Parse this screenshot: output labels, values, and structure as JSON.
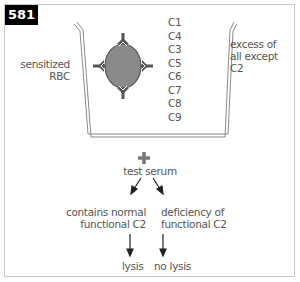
{
  "figure": {
    "number": "581"
  },
  "tube": {
    "left_label": [
      "sensitized",
      "RBC"
    ],
    "right_label": [
      "excess of",
      "all except",
      "C2"
    ],
    "components": [
      "C1",
      "C4",
      "C3",
      "C5",
      "C6",
      "C7",
      "C8",
      "C9"
    ]
  },
  "flow": {
    "plus_symbol": "+",
    "test": "test serum",
    "branches": [
      {
        "condition": [
          "contains normal",
          "functional C2"
        ],
        "result": "lysis"
      },
      {
        "condition": [
          "deficiency of",
          "functional C2"
        ],
        "result": "no lysis"
      }
    ]
  },
  "colors": {
    "cell_fill": "#8a8a8a",
    "line": "#555555",
    "tube": "#888888",
    "badge_bg": "#000000"
  }
}
